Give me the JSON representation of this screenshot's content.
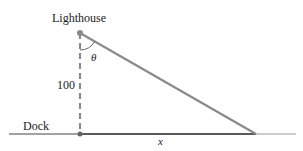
{
  "diagram": {
    "type": "right-triangle-word-problem",
    "labels": {
      "lighthouse": "Lighthouse",
      "height": "100",
      "dock": "Dock",
      "angle": "θ",
      "distance": "x"
    },
    "points": {
      "lighthouse": [
        80,
        33
      ],
      "dock_foot": [
        80,
        134
      ],
      "far_end": [
        256,
        134
      ]
    },
    "colors": {
      "line": "#8a8a8a",
      "base": "#5a5a5a",
      "ground": "#444444",
      "text": "#222222"
    }
  }
}
